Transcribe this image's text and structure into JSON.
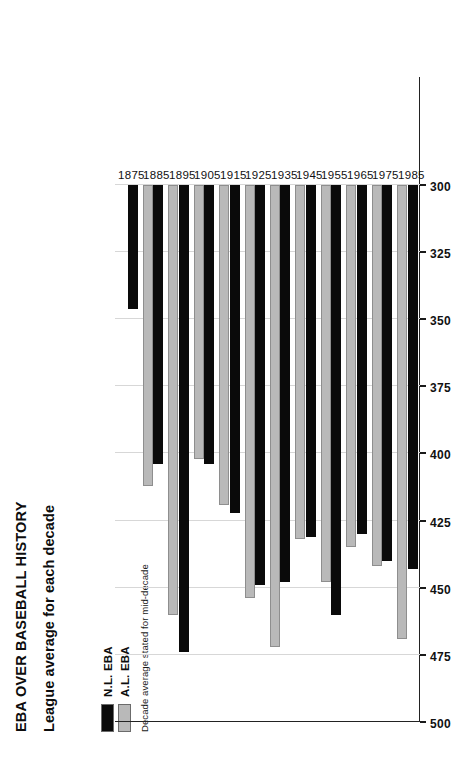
{
  "header": {
    "title": "EBA OVER BASEBALL HISTORY",
    "subtitle": "League average for each decade"
  },
  "legend": {
    "items": [
      {
        "label": "N.L. EBA",
        "color": "#0a0a0a"
      },
      {
        "label": "A.L. EBA",
        "color": "#b9b9b9"
      }
    ],
    "note": "Decade average stated for mid-decade"
  },
  "chart_data": {
    "type": "bar",
    "orientation": "horizontal",
    "title": "EBA OVER BASEBALL HISTORY",
    "subtitle": "League average for each decade",
    "xlabel": "",
    "ylabel": "",
    "grid": true,
    "legend_position": "top-left",
    "value_axis": {
      "min": 300,
      "max": 500,
      "reversed": true,
      "ticks": [
        500,
        475,
        450,
        425,
        400,
        375,
        350,
        325,
        300
      ],
      "tick_labels": [
        "500",
        "475",
        "450",
        "425",
        "400",
        "375",
        "350",
        "325",
        "300"
      ]
    },
    "categories": [
      "1875",
      "1885",
      "1895",
      "1905",
      "1915",
      "1925",
      "1935",
      "1945",
      "1955",
      "1965",
      "1975",
      "1985"
    ],
    "series": [
      {
        "name": "N.L. EBA",
        "color": "#0a0a0a",
        "values": [
          346,
          404,
          474,
          404,
          422,
          449,
          448,
          431,
          460,
          430,
          440,
          443
        ]
      },
      {
        "name": "A.L. EBA",
        "color": "#b9b9b9",
        "values": [
          null,
          412,
          460,
          402,
          419,
          454,
          472,
          432,
          448,
          435,
          442,
          469
        ]
      }
    ]
  }
}
